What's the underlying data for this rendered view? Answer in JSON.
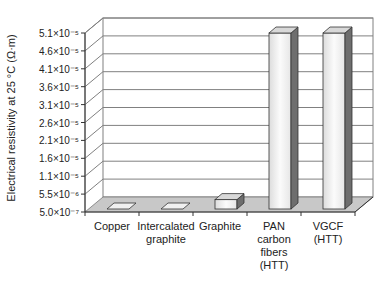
{
  "chart_data": {
    "type": "bar",
    "style": "3d-column",
    "title": "",
    "xlabel": "",
    "ylabel": "Electrical resistivity at 25 °C (Ω·m)",
    "categories": [
      "Copper",
      "Intercalated graphite",
      "Graphite",
      "PAN carbon fibers (HTT)",
      "VGCF (HTT)"
    ],
    "category_label_lines": [
      [
        "Copper"
      ],
      [
        "Intercalated",
        "graphite"
      ],
      [
        "Graphite"
      ],
      [
        "PAN",
        "carbon",
        "fibers",
        "(HTT)"
      ],
      [
        "VGCF",
        "(HTT)"
      ]
    ],
    "values": [
      1.7e-08,
      5.1e-08,
      4e-06,
      5.1e-05,
      5.1e-05
    ],
    "yticks": [
      "5.0×10⁻⁷",
      "5.5×10⁻⁶",
      "1.1×10⁻⁵",
      "1.6×10⁻⁵",
      "2.1×10⁻⁵",
      "2.6×10⁻⁵",
      "3.1×10⁻⁵",
      "3.6×10⁻⁵",
      "4.1×10⁻⁵",
      "4.6×10⁻⁵",
      "5.1×10⁻⁵"
    ],
    "ylim": [
      5e-07,
      5.1e-05
    ],
    "grid": true,
    "legend": null
  },
  "colors": {
    "bar_front": "#f2f2f2",
    "bar_side": "#6e6e6e",
    "bar_top": "#d8d8d8",
    "floor": "#c8c8c8",
    "grid": "#808080"
  }
}
